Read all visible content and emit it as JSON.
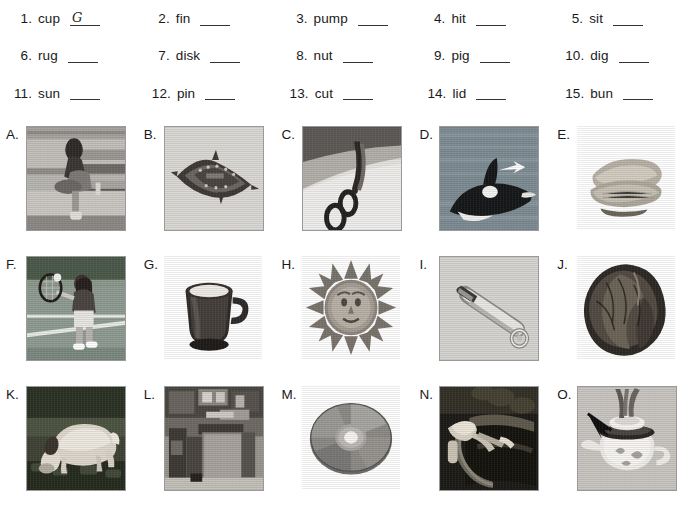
{
  "worksheet": {
    "words": [
      {
        "num": "1.",
        "word": "cup",
        "answer": "G"
      },
      {
        "num": "2.",
        "word": "fin",
        "answer": ""
      },
      {
        "num": "3.",
        "word": "pump",
        "answer": ""
      },
      {
        "num": "4.",
        "word": "hit",
        "answer": ""
      },
      {
        "num": "5.",
        "word": "sit",
        "answer": ""
      },
      {
        "num": "6.",
        "word": "rug",
        "answer": ""
      },
      {
        "num": "7.",
        "word": "disk",
        "answer": ""
      },
      {
        "num": "8.",
        "word": "nut",
        "answer": ""
      },
      {
        "num": "9.",
        "word": "pig",
        "answer": ""
      },
      {
        "num": "10.",
        "word": "dig",
        "answer": ""
      },
      {
        "num": "11.",
        "word": "sun",
        "answer": ""
      },
      {
        "num": "12.",
        "word": "pin",
        "answer": ""
      },
      {
        "num": "13.",
        "word": "cut",
        "answer": ""
      },
      {
        "num": "14.",
        "word": "lid",
        "answer": ""
      },
      {
        "num": "15.",
        "word": "bun",
        "answer": ""
      }
    ],
    "pictures": [
      {
        "label": "A.",
        "icon": "girl-sitting-on-bench-photo",
        "bordered": true
      },
      {
        "label": "B.",
        "icon": "rug-photo",
        "bordered": true
      },
      {
        "label": "C.",
        "icon": "scissors-cutting-photo",
        "bordered": true
      },
      {
        "label": "D.",
        "icon": "orca-dorsal-fin-photo",
        "bordered": true
      },
      {
        "label": "E.",
        "icon": "bun-photo",
        "bordered": false
      },
      {
        "label": "F.",
        "icon": "tennis-player-hitting-photo",
        "bordered": true
      },
      {
        "label": "G.",
        "icon": "cup-photo",
        "bordered": false
      },
      {
        "label": "H.",
        "icon": "sun-ornament-photo",
        "bordered": false
      },
      {
        "label": "I.",
        "icon": "safety-pin-photo",
        "bordered": true
      },
      {
        "label": "J.",
        "icon": "walnut-photo",
        "bordered": false
      },
      {
        "label": "K.",
        "icon": "pig-photo",
        "bordered": true
      },
      {
        "label": "L.",
        "icon": "pump-photo",
        "bordered": true
      },
      {
        "label": "M.",
        "icon": "compact-disk-photo",
        "bordered": false
      },
      {
        "label": "N.",
        "icon": "hand-digging-photo",
        "bordered": true
      },
      {
        "label": "O.",
        "icon": "teapot-lid-photo",
        "bordered": true
      }
    ],
    "colors": {
      "page_background": "#ffffff",
      "text": "#1a1a1a",
      "blank_rule": "#333333",
      "photo_border": "#9a9a9a",
      "photo_gray_backdrop": "#c9c9c9"
    }
  }
}
